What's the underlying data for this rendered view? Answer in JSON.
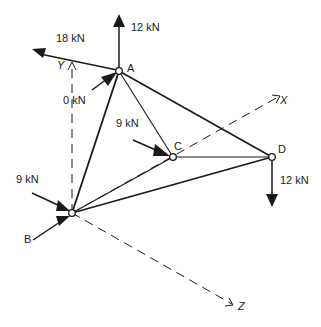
{
  "diagram": {
    "type": "space truss (3D tetrahedral frame)",
    "nodes": [
      {
        "id": "A",
        "label": "A",
        "x": 119,
        "y": 71
      },
      {
        "id": "B",
        "label": "B",
        "x": 72,
        "y": 213
      },
      {
        "id": "C",
        "label": "C",
        "x": 173,
        "y": 157
      },
      {
        "id": "D",
        "label": "D",
        "x": 272,
        "y": 157
      }
    ],
    "members": [
      {
        "from": "A",
        "to": "B",
        "weight": "thick"
      },
      {
        "from": "A",
        "to": "C",
        "weight": "thin"
      },
      {
        "from": "A",
        "to": "D",
        "weight": "thick"
      },
      {
        "from": "B",
        "to": "C",
        "weight": "thin"
      },
      {
        "from": "B",
        "to": "D",
        "weight": "thick"
      },
      {
        "from": "C",
        "to": "D",
        "weight": "thin"
      }
    ],
    "axes": {
      "x": {
        "label": "X"
      },
      "y": {
        "label": "Y"
      },
      "z": {
        "label": "Z"
      }
    },
    "loads": {
      "a_vertical": {
        "label": "12 kN",
        "node": "A",
        "direction": "up"
      },
      "a_diagonal": {
        "label": "18 kN",
        "node": "A",
        "direction": "up-left"
      },
      "a_incoming": {
        "label": "0 kN",
        "node": "A",
        "direction": "toward node from lower-left"
      },
      "c_incoming": {
        "label": "9 kN",
        "node": "C",
        "direction": "toward node from upper-left"
      },
      "d_vertical": {
        "label": "12 kN",
        "node": "D",
        "direction": "down"
      },
      "b_incoming": {
        "label": "9 kN",
        "node": "B",
        "direction": "toward node from upper-left"
      },
      "b_reaction": {
        "node": "B",
        "direction": "toward node from lower-left"
      }
    }
  }
}
